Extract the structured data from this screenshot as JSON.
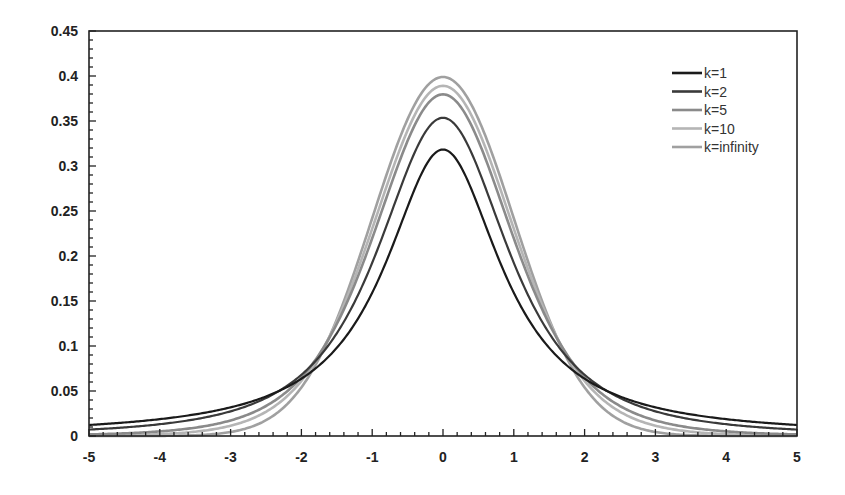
{
  "chart_data": {
    "type": "line",
    "title": "",
    "xlabel": "",
    "ylabel": "",
    "xlim": [
      -5,
      5
    ],
    "ylim": [
      0,
      0.45
    ],
    "grid": false,
    "legend_position": "upper right",
    "x_ticks": [
      "-5",
      "-4",
      "-3",
      "-2",
      "-1",
      "0",
      "1",
      "2",
      "3",
      "4",
      "5"
    ],
    "y_ticks": [
      "0",
      "0.05",
      "0.1",
      "0.15",
      "0.2",
      "0.25",
      "0.3",
      "0.35",
      "0.4",
      "0.45"
    ],
    "x": [
      -5,
      -4,
      -3,
      -2.5,
      -2,
      -1.5,
      -1,
      -0.5,
      0,
      0.5,
      1,
      1.5,
      2,
      2.5,
      3,
      4,
      5
    ],
    "series": [
      {
        "name": "k=1",
        "color": "#1a1a1a",
        "k": 1,
        "values": [
          0.012,
          0.019,
          0.032,
          0.044,
          0.064,
          0.098,
          0.159,
          0.255,
          0.318,
          0.255,
          0.159,
          0.098,
          0.064,
          0.044,
          0.032,
          0.019,
          0.012
        ]
      },
      {
        "name": "k=2",
        "color": "#3a3a3a",
        "k": 2,
        "values": [
          0.007,
          0.013,
          0.027,
          0.04,
          0.068,
          0.114,
          0.192,
          0.299,
          0.354,
          0.299,
          0.192,
          0.114,
          0.068,
          0.04,
          0.027,
          0.013,
          0.007
        ]
      },
      {
        "name": "k=5",
        "color": "#8a8a8a",
        "k": 5,
        "values": [
          0.002,
          0.005,
          0.017,
          0.035,
          0.065,
          0.124,
          0.22,
          0.335,
          0.38,
          0.335,
          0.22,
          0.124,
          0.065,
          0.035,
          0.017,
          0.005,
          0.002
        ]
      },
      {
        "name": "k=10",
        "color": "#b5b5b5",
        "k": 10,
        "values": [
          0.0004,
          0.002,
          0.011,
          0.028,
          0.061,
          0.127,
          0.23,
          0.346,
          0.389,
          0.346,
          0.23,
          0.127,
          0.061,
          0.028,
          0.011,
          0.002,
          0.0004
        ]
      },
      {
        "name": "k=infinity",
        "color": "#a0a0a0",
        "k": "infinity",
        "values": [
          1.5e-06,
          0.0001,
          0.004,
          0.018,
          0.054,
          0.13,
          0.242,
          0.352,
          0.399,
          0.352,
          0.242,
          0.13,
          0.054,
          0.018,
          0.004,
          0.0001,
          1.5e-06
        ]
      }
    ]
  }
}
